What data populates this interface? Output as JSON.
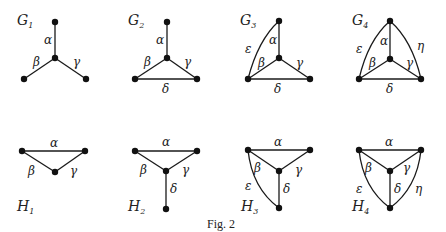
{
  "caption": "Fig. 2",
  "graphs": {
    "G1": {
      "letter": "G",
      "sub": "1",
      "alpha": "α",
      "beta": "β",
      "gamma": "γ"
    },
    "G2": {
      "letter": "G",
      "sub": "2",
      "alpha": "α",
      "beta": "β",
      "gamma": "γ",
      "delta": "δ"
    },
    "G3": {
      "letter": "G",
      "sub": "3",
      "alpha": "α",
      "beta": "β",
      "gamma": "γ",
      "delta": "δ",
      "epsilon": "ε"
    },
    "G4": {
      "letter": "G",
      "sub": "4",
      "alpha": "α",
      "beta": "β",
      "gamma": "γ",
      "delta": "δ",
      "epsilon": "ε",
      "eta": "η"
    },
    "H1": {
      "letter": "H",
      "sub": "1",
      "alpha": "α",
      "beta": "β",
      "gamma": "γ"
    },
    "H2": {
      "letter": "H",
      "sub": "2",
      "alpha": "α",
      "beta": "β",
      "gamma": "γ",
      "delta": "δ"
    },
    "H3": {
      "letter": "H",
      "sub": "3",
      "alpha": "α",
      "beta": "β",
      "gamma": "γ",
      "delta": "δ",
      "epsilon": "ε"
    },
    "H4": {
      "letter": "H",
      "sub": "4",
      "alpha": "α",
      "beta": "β",
      "gamma": "γ",
      "delta": "δ",
      "epsilon": "ε",
      "eta": "η"
    }
  }
}
